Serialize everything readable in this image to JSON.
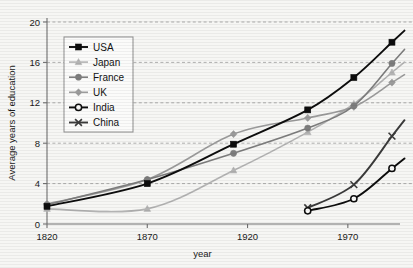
{
  "chart_data": {
    "type": "line",
    "title": "",
    "xlabel": "year",
    "ylabel": "Average years of education",
    "xlim": [
      1820,
      2000
    ],
    "ylim": [
      0,
      20
    ],
    "xticks": [
      1820,
      1870,
      1920,
      1970
    ],
    "yticks": [
      0,
      4,
      8,
      12,
      16,
      20
    ],
    "grid": true,
    "legend_position": "upper-left",
    "series": [
      {
        "name": "USA",
        "color": "#0d0d0d",
        "marker": "filled-square",
        "x": [
          1820,
          1870,
          1913,
          1950,
          1973,
          1992
        ],
        "values": [
          1.75,
          4.0,
          7.9,
          11.3,
          14.5,
          18.0
        ]
      },
      {
        "name": "Japan",
        "color": "#b3b3b3",
        "marker": "filled-triangle",
        "x": [
          1820,
          1870,
          1913,
          1950,
          1973,
          1992
        ],
        "values": [
          1.5,
          1.5,
          5.3,
          9.1,
          11.9,
          15.0
        ]
      },
      {
        "name": "France",
        "color": "#7d7d7d",
        "marker": "filled-circle",
        "x": [
          1820,
          1870,
          1913,
          1950,
          1973,
          1992
        ],
        "values": [
          1.9,
          4.4,
          7.0,
          9.5,
          11.7,
          15.9
        ]
      },
      {
        "name": "UK",
        "color": "#9b9b9b",
        "marker": "filled-diamond",
        "x": [
          1820,
          1870,
          1913,
          1950,
          1973,
          1992
        ],
        "values": [
          2.0,
          4.4,
          8.9,
          10.5,
          11.6,
          14.0
        ]
      },
      {
        "name": "India",
        "color": "#0d0d0d",
        "marker": "open-circle",
        "x": [
          1950,
          1973,
          1992
        ],
        "values": [
          1.3,
          2.5,
          5.5
        ]
      },
      {
        "name": "China",
        "color": "#3a3a3a",
        "marker": "x-cross",
        "x": [
          1950,
          1973,
          1992
        ],
        "values": [
          1.6,
          3.9,
          8.7
        ]
      }
    ]
  },
  "legend": {
    "items": [
      {
        "label": "USA"
      },
      {
        "label": "Japan"
      },
      {
        "label": "France"
      },
      {
        "label": "UK"
      },
      {
        "label": "India"
      },
      {
        "label": "China"
      }
    ]
  },
  "axes": {
    "x_tick_labels": [
      "1820",
      "1870",
      "1920",
      "1970"
    ],
    "y_tick_labels": [
      "0",
      "4",
      "8",
      "12",
      "16",
      "20"
    ],
    "x_title": "year",
    "y_title": "Average years of education"
  }
}
